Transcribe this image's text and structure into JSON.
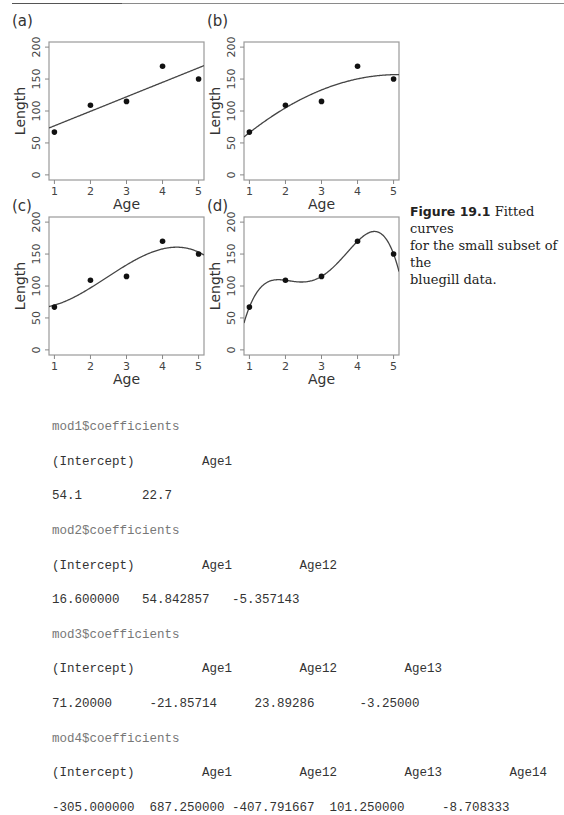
{
  "figure": {
    "number": "Figure 19.1",
    "caption": "Fitted curves for the small subset of the bluegill data.",
    "caption_lines": [
      "Fitted curves",
      "for the small subset of the",
      "bluegill data."
    ]
  },
  "chart_data": [
    {
      "panel": "(a)",
      "type": "scatter",
      "title": "",
      "xlabel": "Age",
      "ylabel": "Length",
      "x": [
        1,
        2,
        3,
        4,
        5
      ],
      "y": [
        67,
        109,
        115,
        170,
        150
      ],
      "xticks": [
        1,
        2,
        3,
        4,
        5
      ],
      "yticks": [
        0,
        50,
        100,
        150,
        200
      ],
      "xlim": [
        0.85,
        5.15
      ],
      "ylim": [
        -8,
        208
      ],
      "grid": false,
      "fit": {
        "degree": 1,
        "coefficients": [
          54.1,
          22.7
        ]
      }
    },
    {
      "panel": "(b)",
      "type": "scatter",
      "title": "",
      "xlabel": "Age",
      "ylabel": "Length",
      "x": [
        1,
        2,
        3,
        4,
        5
      ],
      "y": [
        67,
        109,
        115,
        170,
        150
      ],
      "xticks": [
        1,
        2,
        3,
        4,
        5
      ],
      "yticks": [
        0,
        50,
        100,
        150,
        200
      ],
      "xlim": [
        0.85,
        5.15
      ],
      "ylim": [
        -8,
        208
      ],
      "grid": false,
      "fit": {
        "degree": 2,
        "coefficients": [
          16.6,
          54.842857,
          -5.357143
        ]
      }
    },
    {
      "panel": "(c)",
      "type": "scatter",
      "title": "",
      "xlabel": "Age",
      "ylabel": "Length",
      "x": [
        1,
        2,
        3,
        4,
        5
      ],
      "y": [
        67,
        109,
        115,
        170,
        150
      ],
      "xticks": [
        1,
        2,
        3,
        4,
        5
      ],
      "yticks": [
        0,
        50,
        100,
        150,
        200
      ],
      "xlim": [
        0.85,
        5.15
      ],
      "ylim": [
        -8,
        208
      ],
      "grid": false,
      "fit": {
        "degree": 3,
        "coefficients": [
          71.2,
          -21.85714,
          23.89286,
          -3.25
        ]
      }
    },
    {
      "panel": "(d)",
      "type": "scatter",
      "title": "",
      "xlabel": "Age",
      "ylabel": "Length",
      "x": [
        1,
        2,
        3,
        4,
        5
      ],
      "y": [
        67,
        109,
        115,
        170,
        150
      ],
      "xticks": [
        1,
        2,
        3,
        4,
        5
      ],
      "yticks": [
        0,
        50,
        100,
        150,
        200
      ],
      "xlim": [
        0.85,
        5.15
      ],
      "ylim": [
        -8,
        208
      ],
      "grid": false,
      "fit": {
        "degree": 4,
        "coefficients": [
          -305.0,
          687.25,
          -407.791667,
          101.25,
          -8.708333
        ]
      }
    }
  ],
  "code_output": [
    {
      "kind": "cmd",
      "text": "mod1$coefficients"
    },
    {
      "kind": "out",
      "text": "(Intercept)         Age1"
    },
    {
      "kind": "out",
      "text": "54.1        22.7"
    },
    {
      "kind": "cmd",
      "text": "mod2$coefficients"
    },
    {
      "kind": "out",
      "text": "(Intercept)         Age1         Age12"
    },
    {
      "kind": "out",
      "text": "16.600000   54.842857   -5.357143"
    },
    {
      "kind": "cmd",
      "text": "mod3$coefficients"
    },
    {
      "kind": "out",
      "text": "(Intercept)         Age1         Age12         Age13"
    },
    {
      "kind": "out",
      "text": "71.20000     -21.85714     23.89286      -3.25000"
    },
    {
      "kind": "cmd",
      "text": "mod4$coefficients"
    },
    {
      "kind": "out",
      "text": "(Intercept)         Age1         Age12         Age13         Age14"
    },
    {
      "kind": "out",
      "text": "-305.000000  687.250000 -407.791667  101.250000     -8.708333"
    }
  ]
}
